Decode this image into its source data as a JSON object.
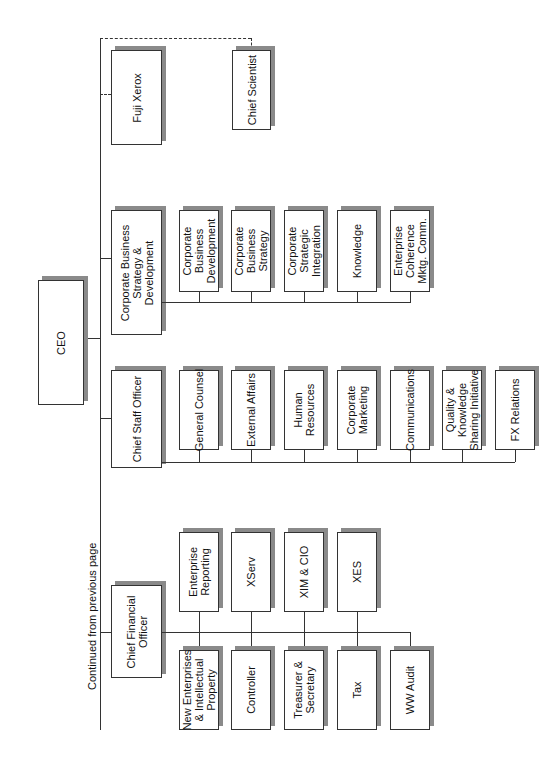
{
  "note": "Continued from previous page",
  "ceo": "CEO",
  "strategy_group": {
    "head": "Corporate Business\nStrategy &\nDevelopment",
    "children": [
      "Corporate\nBusiness\nDevelopment",
      "Corporate\nBusiness\nStrategy",
      "Corporate\nStrategic\nIntegration",
      "Knowledge",
      "Enterprise\nCoherence\nMktg. Comm."
    ]
  },
  "dotted": {
    "fuji": "Fuji Xerox",
    "scientist": "Chief Scientist"
  },
  "staff_group": {
    "head": "Chief Staff Officer",
    "children": [
      "General Counsel",
      "External Affairs",
      "Human\nResources",
      "Corporate\nMarketing",
      "Communications",
      "Quality &\nKnowledge\nSharing Initiative",
      "FX Relations"
    ]
  },
  "cfo_group": {
    "head": "Chief Financial\nOfficer",
    "upper": [
      "Enterprise\nReporting",
      "XServ",
      "XIM & CIO",
      "XES"
    ],
    "lower": [
      "New Enterprises\n& Intellectual\nProperty",
      "Controller",
      "Treasurer &\nSecretary",
      "Tax",
      "WW Audit"
    ]
  }
}
